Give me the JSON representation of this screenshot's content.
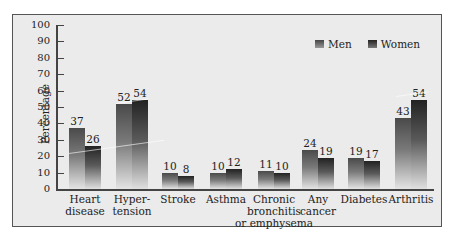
{
  "chart_data": {
    "type": "bar",
    "title": "",
    "xlabel": "",
    "ylabel": "Percentage",
    "ylim": [
      0,
      100
    ],
    "yticks": [
      0,
      10,
      20,
      30,
      40,
      50,
      60,
      70,
      80,
      90,
      100
    ],
    "grid": false,
    "legend_position": "top-right",
    "categories": [
      "Heart disease",
      "Hyper-tension",
      "Stroke",
      "Asthma",
      "Chronic bronchitis or emphysema",
      "Any cancer",
      "Diabetes",
      "Arthritis"
    ],
    "category_lines": [
      [
        "Heart",
        "disease"
      ],
      [
        "Hyper-",
        "tension"
      ],
      [
        "Stroke"
      ],
      [
        "Asthma"
      ],
      [
        "Chronic",
        "bronchitis",
        "or emphysema"
      ],
      [
        "Any",
        "cancer"
      ],
      [
        "Diabetes"
      ],
      [
        "Arthritis"
      ]
    ],
    "series": [
      {
        "name": "Men",
        "values": [
          37,
          52,
          10,
          10,
          11,
          24,
          19,
          43
        ]
      },
      {
        "name": "Women",
        "values": [
          26,
          54,
          8,
          12,
          10,
          19,
          17,
          54
        ]
      }
    ]
  },
  "legend": {
    "men": "Men",
    "women": "Women"
  }
}
